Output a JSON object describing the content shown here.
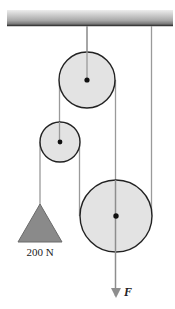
{
  "diagram": {
    "type": "pulley-system",
    "ceiling": {
      "x": 7,
      "y": 10,
      "width": 166,
      "height": 16
    },
    "pulleys": [
      {
        "id": "top",
        "cx": 87,
        "cy": 80,
        "r": 28
      },
      {
        "id": "small",
        "cx": 60,
        "cy": 142,
        "r": 20
      },
      {
        "id": "large",
        "cx": 116,
        "cy": 216,
        "r": 36
      }
    ],
    "load": {
      "label": "200 N",
      "apex_x": 40,
      "apex_y": 204,
      "base_y": 242,
      "base_left": 18,
      "base_right": 62
    },
    "force": {
      "label": "F",
      "x": 116,
      "y_end": 297
    },
    "colors": {
      "pulley_fill": "#e3e3e3",
      "pulley_stroke": "#222222",
      "rope": "#9a9a9a",
      "weight_fill": "#8a8a8a",
      "ceiling_dark": "#555555",
      "ceiling_light": "#e8e8e8"
    }
  }
}
